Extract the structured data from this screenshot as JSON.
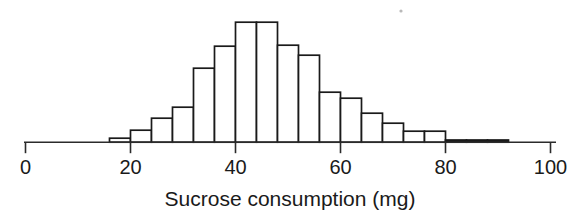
{
  "chart_data": {
    "type": "bar",
    "title": "",
    "subtitle": "",
    "xlabel": "Sucrose consumption (mg)",
    "ylabel": "",
    "grid": false,
    "legend": null,
    "xlim": [
      0,
      100
    ],
    "ylim": [
      0,
      120
    ],
    "xticks": [
      0,
      20,
      40,
      60,
      80,
      100
    ],
    "xtick_labels": [
      "0",
      "20",
      "40",
      "60",
      "80",
      "100"
    ],
    "yticks": [],
    "ytick_labels": [],
    "bin_width": 4,
    "bin_edges": [
      16,
      20,
      24,
      28,
      32,
      36,
      40,
      44,
      48,
      52,
      56,
      60,
      64,
      68,
      72,
      76,
      80,
      84,
      88,
      92
    ],
    "bin_centers": [
      18,
      22,
      26,
      30,
      34,
      38,
      42,
      46,
      50,
      54,
      58,
      62,
      66,
      70,
      74,
      78,
      82,
      86,
      90
    ],
    "categories": [
      "16-20",
      "20-24",
      "24-28",
      "28-32",
      "32-36",
      "36-40",
      "40-44",
      "44-48",
      "48-52",
      "52-56",
      "56-60",
      "60-64",
      "64-68",
      "68-72",
      "72-76",
      "76-80",
      "80-84",
      "84-88",
      "88-92"
    ],
    "values": [
      4,
      12,
      24,
      35,
      74,
      96,
      120,
      120,
      97,
      87,
      50,
      44,
      29,
      19,
      11,
      11,
      0,
      2,
      2
    ]
  },
  "axis": {
    "xlabel": "Sucrose consumption (mg)",
    "tick_labels": [
      "0",
      "20",
      "40",
      "60",
      "80",
      "100"
    ]
  }
}
